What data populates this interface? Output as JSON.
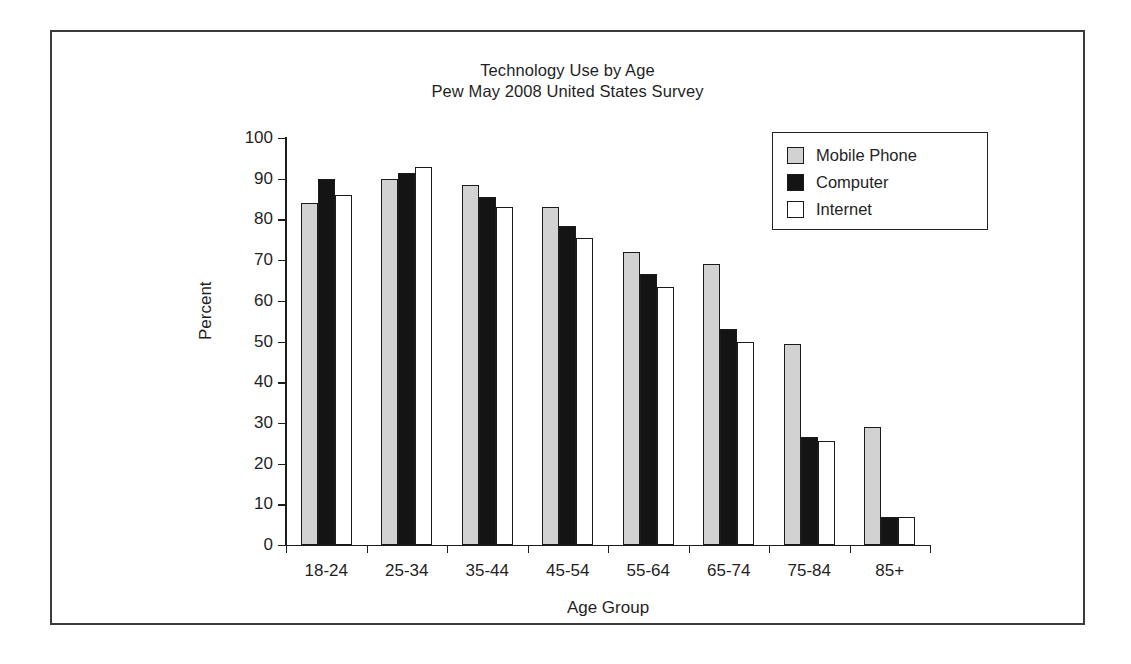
{
  "chart_data": {
    "type": "bar",
    "title": "Technology Use by Age",
    "subtitle": "Pew May 2008 United States Survey",
    "xlabel": "Age Group",
    "ylabel": "Percent",
    "ylim": [
      0,
      100
    ],
    "ytick_step": 10,
    "yticks": [
      0,
      10,
      20,
      30,
      40,
      50,
      60,
      70,
      80,
      90,
      100
    ],
    "grid": false,
    "legend_position": "top-right",
    "categories": [
      "18-24",
      "25-34",
      "35-44",
      "45-54",
      "55-64",
      "65-74",
      "75-84",
      "85+"
    ],
    "series": [
      {
        "name": "Mobile Phone",
        "color": "#d2d2d2",
        "values": [
          84,
          90,
          88.5,
          83,
          72,
          69,
          49.5,
          29
        ]
      },
      {
        "name": "Computer",
        "color": "#141414",
        "values": [
          90,
          91.5,
          85.5,
          78.5,
          66.5,
          53,
          26.5,
          6.8
        ]
      },
      {
        "name": "Internet",
        "color": "#ffffff",
        "values": [
          86,
          93,
          83,
          75.5,
          63.5,
          50,
          25.5,
          6.8
        ]
      }
    ]
  },
  "legend": {
    "items": [
      {
        "label": "Mobile Phone"
      },
      {
        "label": "Computer"
      },
      {
        "label": "Internet"
      }
    ]
  }
}
